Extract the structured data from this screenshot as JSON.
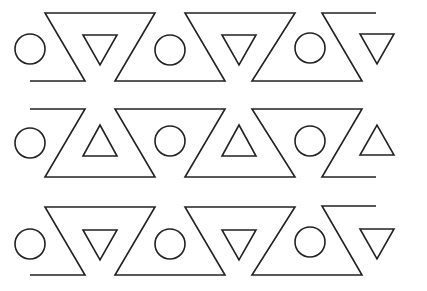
{
  "canvas": {
    "width": 427,
    "height": 291,
    "background": "#ffffff",
    "stroke": "#222222"
  },
  "pattern": {
    "description": "Three rows of a repeating geometric frieze: circles, small triangles, and a zigzag line",
    "rows": [
      {
        "name": "row-1",
        "zigzag": "30,81 85,81 45,13 155,13 115,81 225,81 185,13 295,13 252,81 362,81 322,13 376,13",
        "circles": [
          {
            "cx": 30,
            "cy": 49,
            "r": 15
          },
          {
            "cx": 170,
            "cy": 50,
            "r": 15
          },
          {
            "cx": 310,
            "cy": 48,
            "r": 15
          }
        ],
        "triangles": [
          "83,35 117,35 100,65",
          "222,35 256,35 239,65",
          "360,34 394,34 377,64"
        ],
        "triangle_direction": "down"
      },
      {
        "name": "row-2",
        "zigzag": "30,109 85,109 45,177 155,177 115,109 225,109 185,177 295,177 252,109 362,109 322,177 376,177",
        "circles": [
          {
            "cx": 30,
            "cy": 143,
            "r": 15
          },
          {
            "cx": 170,
            "cy": 141,
            "r": 15
          },
          {
            "cx": 310,
            "cy": 141,
            "r": 15
          }
        ],
        "triangles": [
          "83,156 117,156 100,125",
          "222,156 256,156 239,125",
          "360,155 394,155 377,125"
        ],
        "triangle_direction": "up"
      },
      {
        "name": "row-3",
        "zigzag": "30,275 85,275 45,207 155,207 115,275 225,275 185,207 295,207 252,275 362,275 322,206 376,206",
        "circles": [
          {
            "cx": 30,
            "cy": 244,
            "r": 15
          },
          {
            "cx": 170,
            "cy": 244,
            "r": 15
          },
          {
            "cx": 310,
            "cy": 242,
            "r": 15
          }
        ],
        "triangles": [
          "83,230 117,230 100,260",
          "222,230 256,230 239,260",
          "360,229 394,229 377,259"
        ],
        "triangle_direction": "down"
      }
    ]
  }
}
